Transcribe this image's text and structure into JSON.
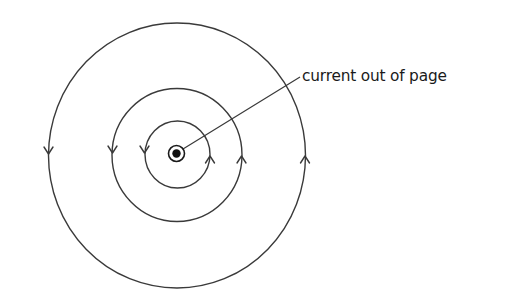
{
  "diagram": {
    "label": "current out of page",
    "center": {
      "x": 177,
      "y": 155
    },
    "wire": {
      "symbol": "dot-in-circle",
      "meaning": "current out of page",
      "outer_radius": 8,
      "inner_radius": 4,
      "x": 176,
      "y": 153
    },
    "field_lines": [
      {
        "name": "inner",
        "rx": 33,
        "ry": 33,
        "direction": "counterclockwise"
      },
      {
        "name": "middle",
        "rx": 65,
        "ry": 67,
        "direction": "counterclockwise"
      },
      {
        "name": "outer",
        "rx": 129,
        "ry": 132,
        "direction": "counterclockwise"
      }
    ],
    "arrows": [
      {
        "circle": "outer",
        "side": "left",
        "x": 48,
        "y": 153,
        "points": "down"
      },
      {
        "circle": "middle",
        "side": "left",
        "x": 112,
        "y": 152,
        "points": "down"
      },
      {
        "circle": "inner",
        "side": "left",
        "x": 144,
        "y": 152,
        "points": "down"
      },
      {
        "circle": "inner",
        "side": "right",
        "x": 210,
        "y": 157,
        "points": "up"
      },
      {
        "circle": "middle",
        "side": "right",
        "x": 242,
        "y": 157,
        "points": "up"
      },
      {
        "circle": "outer",
        "side": "right",
        "x": 305,
        "y": 157,
        "points": "up"
      }
    ],
    "leader_line": {
      "x1": 183,
      "y1": 149,
      "x2": 300,
      "y2": 77
    },
    "colors": {
      "line": "#3a3a3a",
      "text": "#1a1a1a",
      "background": "#ffffff"
    }
  }
}
